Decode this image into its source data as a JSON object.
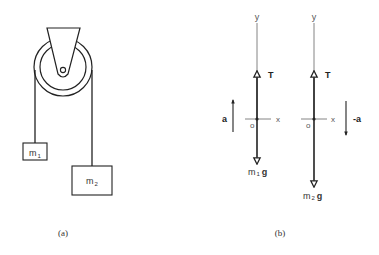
{
  "figure_a": {
    "caption": "(a)",
    "mass1": {
      "label": "m",
      "subscript": "1"
    },
    "mass2": {
      "label": "m",
      "subscript": "2"
    }
  },
  "figure_b": {
    "caption": "(b)",
    "fbd1": {
      "y_axis": "y",
      "x_axis": "x",
      "origin": "o",
      "tension": "T",
      "weight": {
        "label": "m",
        "subscript": "1",
        "suffix": "g"
      },
      "acceleration": "a"
    },
    "fbd2": {
      "y_axis": "y",
      "x_axis": "x",
      "origin": "o",
      "tension": "T",
      "weight": {
        "label": "m",
        "subscript": "2",
        "suffix": "g"
      },
      "acceleration": "-a"
    }
  },
  "colors": {
    "line": "#222222",
    "axis": "#555555",
    "background": "#ffffff"
  }
}
